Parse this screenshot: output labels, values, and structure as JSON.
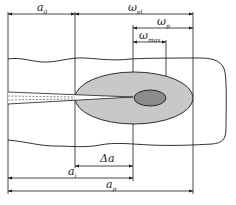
{
  "diagram": {
    "type": "crack-tip plastic zone dimension schematic",
    "colors": {
      "line": "#1a1a1a",
      "plastic_zone_large": "#c8c8c8",
      "plastic_zone_small": "#8c8c8c",
      "background": "#ffffff"
    },
    "labels": {
      "a0": {
        "base": "a",
        "sub": "0"
      },
      "omega_el": {
        "base": "ω",
        "sub": "el"
      },
      "omega_p": {
        "base": "ω",
        "sub": "p"
      },
      "omega_max": {
        "base": "ω",
        "sub": "max"
      },
      "delta_a": {
        "base": "Δa",
        "sub": ""
      },
      "ai": {
        "base": "a",
        "sub": "i"
      },
      "ap": {
        "base": "a",
        "sub": "p"
      }
    },
    "elements": [
      "specimen-plate",
      "crack",
      "large-plastic-zone-ellipse",
      "small-plastic-zone-ellipse",
      "dimension-lines"
    ]
  }
}
